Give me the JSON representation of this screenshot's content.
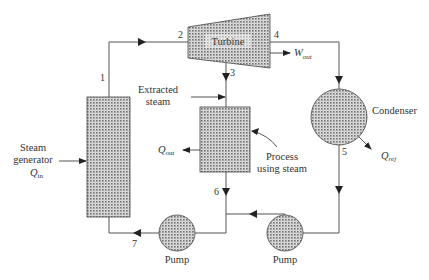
{
  "diagram": {
    "type": "cogeneration-cycle",
    "components": {
      "steam_generator": {
        "label_line1": "Steam",
        "label_line2": "generator",
        "heat_label": "Q",
        "heat_sub": "in"
      },
      "turbine": {
        "label": "Turbine",
        "work_label": "W",
        "work_sub": "out"
      },
      "extracted_steam": {
        "label_line1": "Extracted",
        "label_line2": "steam"
      },
      "process": {
        "label_line1": "Process",
        "label_line2": "using steam",
        "heat_label": "Q",
        "heat_sub": "out"
      },
      "condenser": {
        "label": "Condenser",
        "heat_label": "Q",
        "heat_sub": "rej"
      },
      "pump_left": {
        "label": "Pump"
      },
      "pump_right": {
        "label": "Pump"
      }
    },
    "states": [
      "1",
      "2",
      "3",
      "4",
      "5",
      "6",
      "7"
    ],
    "colors": {
      "line": "#555555",
      "fill_dark": "#8a8a8a",
      "fill_light": "#d4d4d4",
      "text": "#333333"
    }
  }
}
